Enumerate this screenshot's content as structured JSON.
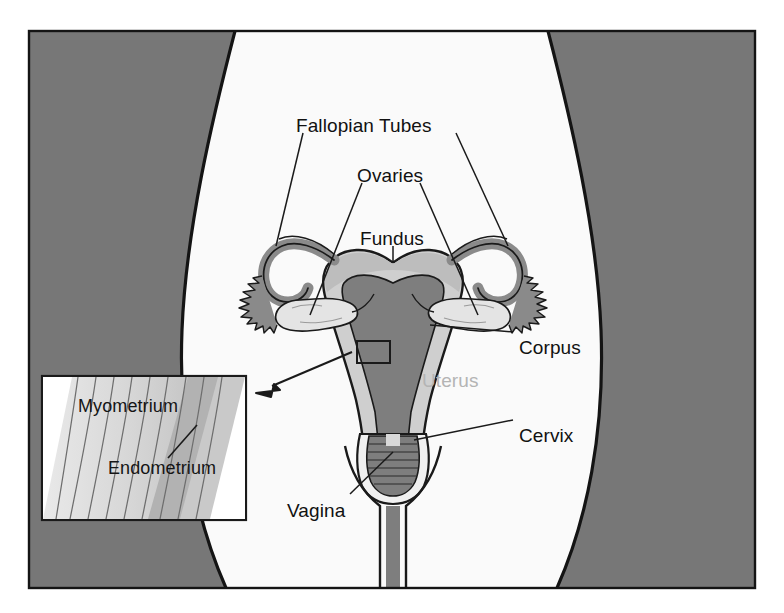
{
  "figure": {
    "frame": {
      "border_color": "#141414",
      "background_color": "#f8f8f8",
      "body_silhouette_color": "#f9f9f9",
      "corner_shade_color": "#777777"
    },
    "palette": {
      "outline": "#1a1a1a",
      "dark_tissue": "#7a7a7a",
      "mid_tissue": "#b9b9b9",
      "light_tissue": "#dcdcdc",
      "pale_tissue": "#efefef",
      "ghost_text": "#b4b4b4"
    }
  },
  "labels": [
    {
      "id": "fallopian-tubes",
      "text": "Fallopian Tubes",
      "x": 296,
      "y": 115,
      "style": "normal"
    },
    {
      "id": "ovaries",
      "text": "Ovaries",
      "x": 357,
      "y": 165,
      "style": "normal"
    },
    {
      "id": "fundus",
      "text": "Fundus",
      "x": 360,
      "y": 228,
      "style": "normal"
    },
    {
      "id": "corpus",
      "text": "Corpus",
      "x": 519,
      "y": 337,
      "style": "normal"
    },
    {
      "id": "uterus",
      "text": "Uterus",
      "x": 422,
      "y": 370,
      "style": "ghost"
    },
    {
      "id": "cervix",
      "text": "Cervix",
      "x": 519,
      "y": 425,
      "style": "normal"
    },
    {
      "id": "vagina",
      "text": "Vagina",
      "x": 287,
      "y": 500,
      "style": "normal"
    }
  ],
  "inset": {
    "id": "myometrium-endometrium-inset",
    "box": {
      "x": 42,
      "y": 376,
      "width": 204,
      "height": 144
    },
    "labels": [
      {
        "id": "myometrium",
        "text": "Myometrium",
        "x": 78,
        "y": 396
      },
      {
        "id": "endometrium",
        "text": "Endometrium",
        "x": 108,
        "y": 458
      }
    ]
  },
  "callout": {
    "id": "uterine-wall-callout",
    "rect": {
      "x": 357,
      "y": 341,
      "width": 33,
      "height": 22
    },
    "arrow_from": {
      "x": 352,
      "y": 352
    },
    "arrow_to": {
      "x": 258,
      "y": 392
    }
  },
  "structures": [
    {
      "id": "uterus-body",
      "name": "Uterus / Corpus"
    },
    {
      "id": "fundus-dome",
      "name": "Fundus"
    },
    {
      "id": "fallopian-tube-left",
      "name": "Left Fallopian Tube"
    },
    {
      "id": "fallopian-tube-right",
      "name": "Right Fallopian Tube"
    },
    {
      "id": "ovary-left",
      "name": "Left Ovary"
    },
    {
      "id": "ovary-right",
      "name": "Right Ovary"
    },
    {
      "id": "cervix-canal",
      "name": "Cervix"
    },
    {
      "id": "vaginal-canal",
      "name": "Vagina"
    },
    {
      "id": "endometrial-cavity",
      "name": "Endometrial cavity"
    }
  ]
}
